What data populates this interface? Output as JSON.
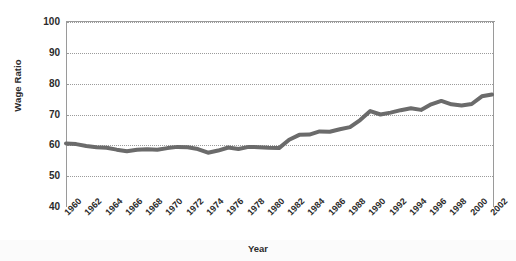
{
  "chart_data": {
    "type": "line",
    "title": "",
    "xlabel": "Year",
    "ylabel": "Wage Ratio",
    "xlim": [
      1960,
      2002
    ],
    "ylim": [
      40,
      100
    ],
    "grid": true,
    "legend": "none",
    "line_color": "#6b6b6b",
    "axis_color": "#9a9a9a",
    "gridline_color": "#9b9b9b",
    "y_ticks": [
      100,
      90,
      80,
      70,
      60,
      50,
      40
    ],
    "x_ticks": [
      1960,
      1962,
      1964,
      1966,
      1968,
      1970,
      1972,
      1974,
      1976,
      1978,
      1980,
      1982,
      1984,
      1986,
      1988,
      1990,
      1992,
      1994,
      1996,
      1998,
      2000,
      2002
    ],
    "series": [
      {
        "name": "Wage Ratio",
        "x": [
          1960,
          1961,
          1962,
          1963,
          1964,
          1965,
          1966,
          1967,
          1968,
          1969,
          1970,
          1971,
          1972,
          1973,
          1974,
          1975,
          1976,
          1977,
          1978,
          1979,
          1980,
          1981,
          1982,
          1983,
          1984,
          1985,
          1986,
          1987,
          1988,
          1989,
          1990,
          1991,
          1992,
          1993,
          1994,
          1995,
          1996,
          1997,
          1998,
          1999,
          2000,
          2001,
          2002
        ],
        "values": [
          60.6,
          60.4,
          59.8,
          59.4,
          59.2,
          58.6,
          58.1,
          58.6,
          58.7,
          58.6,
          59.1,
          59.5,
          59.4,
          58.8,
          57.6,
          58.3,
          59.3,
          58.8,
          59.5,
          59.4,
          59.2,
          59.1,
          61.8,
          63.4,
          63.5,
          64.5,
          64.4,
          65.2,
          65.9,
          68.2,
          71.1,
          70.0,
          70.6,
          71.4,
          72.0,
          71.5,
          73.3,
          74.4,
          73.3,
          72.9,
          73.4,
          75.9,
          76.5
        ]
      }
    ]
  },
  "axes": {
    "y_title": "Wage Ratio",
    "x_title": "Year"
  }
}
